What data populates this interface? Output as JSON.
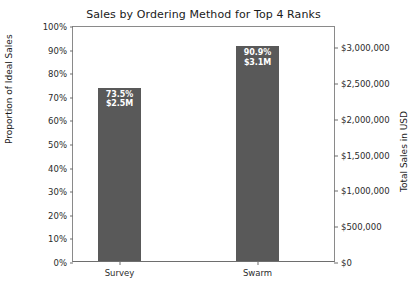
{
  "chart_data": {
    "type": "bar",
    "title": "Sales by Ordering Method for Top 4 Ranks",
    "categories": [
      "Survey",
      "Swarm"
    ],
    "values": [
      73.5,
      90.9
    ],
    "value_labels": [
      {
        "percent": "73.5%",
        "amount": "$2.5M"
      },
      {
        "percent": "90.9%",
        "amount": "$3.1M"
      }
    ],
    "xlabel": "",
    "ylabel": "Proportion of Ideal Sales",
    "ylabel_secondary": "Total Sales in USD",
    "ylim": [
      0,
      100
    ],
    "ylim_secondary": [
      0,
      3300000
    ],
    "yticks": [
      "0%",
      "10%",
      "20%",
      "30%",
      "40%",
      "50%",
      "60%",
      "70%",
      "80%",
      "90%",
      "100%"
    ],
    "ytick_values": [
      0,
      10,
      20,
      30,
      40,
      50,
      60,
      70,
      80,
      90,
      100
    ],
    "yticks_secondary": [
      "$0",
      "$500,000",
      "$1,000,000",
      "$1,500,000",
      "$2,000,000",
      "$2,500,000",
      "$3,000,000"
    ],
    "ytick_secondary_values": [
      0,
      500000,
      1000000,
      1500000,
      2000000,
      2500000,
      3000000
    ],
    "grid": false,
    "legend": false,
    "bar_color": "#595959",
    "label_text_color": "#ffffff",
    "axis_color": "#6e6e6e",
    "background_color": "#ffffff"
  }
}
